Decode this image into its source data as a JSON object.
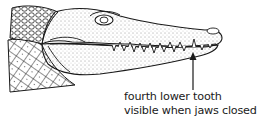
{
  "illustration": {
    "subject": "crocodile head in side profile",
    "annotation": {
      "line1": "fourth lower tooth",
      "line2": "visible when jaws closed"
    },
    "colors": {
      "ink": "#1a1a1a",
      "background": "#ffffff"
    }
  }
}
